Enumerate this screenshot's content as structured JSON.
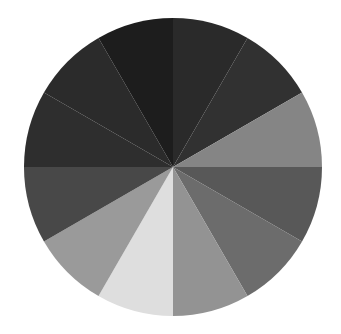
{
  "chart_data": {
    "type": "pie",
    "title": "",
    "categories": [
      "1",
      "2",
      "3",
      "4",
      "5",
      "6",
      "7",
      "8",
      "9",
      "10",
      "11",
      "12"
    ],
    "values": [
      1,
      1,
      1,
      1,
      1,
      1,
      1,
      1,
      1,
      1,
      1,
      1
    ],
    "colors": [
      "#2a2a2a",
      "#313131",
      "#858585",
      "#585858",
      "#6c6c6c",
      "#939393",
      "#dedede",
      "#9a9a9a",
      "#484848",
      "#2e2e2e",
      "#2b2b2b",
      "#1d1d1d"
    ],
    "start_angle_deg": 0,
    "direction": "clockwise",
    "legend": null,
    "labels_shown": false
  },
  "layout": {
    "cx": 173,
    "cy": 167,
    "r": 149
  }
}
